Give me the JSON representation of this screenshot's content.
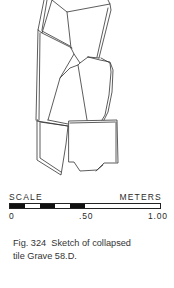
{
  "figure": {
    "number_label": "Fig. 324",
    "caption_text": "Sketch of collapsed tile Grave 58.D.",
    "caption_line1": "Fig. 324  Sketch of collapsed",
    "caption_line2": "tile Grave 58.D."
  },
  "scale": {
    "title": "SCALE",
    "units": "METERS",
    "ticks": [
      {
        "label": "0",
        "left_px": 9
      },
      {
        "label": ".50",
        "left_px": 79
      },
      {
        "label": "1.00",
        "left_px": 148
      }
    ],
    "segments": [
      "black",
      "white",
      "black",
      "white",
      "black",
      "white"
    ],
    "segment_widths_px": [
      15,
      15,
      15,
      15,
      15,
      75
    ]
  },
  "sketch": {
    "subject": "collapsed tile grave outline drawing",
    "line_color": "#333333"
  }
}
